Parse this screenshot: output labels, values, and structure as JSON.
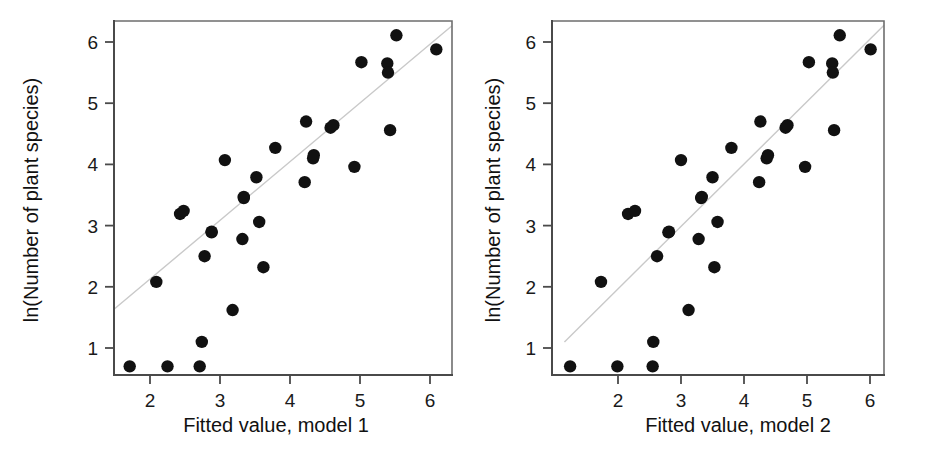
{
  "figure": {
    "background": "#ffffff",
    "point_color": "#111111",
    "line_color": "#c9c9c9",
    "axis_color": "#4a4a4a",
    "panel_count": 2
  },
  "chart_data": [
    {
      "type": "scatter",
      "title": "",
      "xlabel": "Fitted value, model 1",
      "ylabel": "ln(Number of plant species)",
      "xlim": [
        1.4,
        6.35
      ],
      "ylim": [
        0.45,
        6.35
      ],
      "xticks": [
        2,
        3,
        4,
        5,
        6
      ],
      "yticks": [
        1,
        2,
        3,
        4,
        5,
        6
      ],
      "xticklabels": [
        "2",
        "3",
        "4",
        "5",
        "6"
      ],
      "yticklabels": [
        "1",
        "2",
        "3",
        "4",
        "5",
        "6"
      ],
      "grid": false,
      "legend": "none",
      "trendline": {
        "type": "identity-reference",
        "x_start": 1.4,
        "y_start": 1.55,
        "x_end": 6.35,
        "y_end": 6.3
      },
      "x": [
        1.71,
        2.25,
        2.71,
        2.74,
        2.09,
        2.43,
        2.48,
        2.78,
        2.88,
        2.88,
        3.07,
        3.18,
        3.32,
        3.34,
        3.34,
        3.52,
        3.56,
        3.62,
        3.79,
        4.21,
        4.23,
        4.33,
        4.34,
        4.58,
        4.62,
        4.92,
        5.02,
        5.39,
        5.4,
        5.43,
        5.52,
        6.09
      ],
      "y": [
        0.7,
        0.7,
        0.7,
        1.1,
        2.08,
        3.19,
        3.24,
        2.5,
        2.89,
        2.9,
        4.07,
        1.62,
        2.78,
        3.45,
        3.47,
        3.79,
        3.06,
        2.32,
        4.27,
        3.71,
        4.7,
        4.1,
        4.15,
        4.6,
        4.64,
        3.96,
        5.67,
        5.65,
        5.5,
        4.56,
        6.11,
        5.88
      ]
    },
    {
      "type": "scatter",
      "title": "",
      "xlabel": "Fitted value, model 2",
      "ylabel": "ln(Number of plant species)",
      "xlim": [
        1.15,
        6.25
      ],
      "ylim": [
        0.45,
        6.35
      ],
      "xticks": [
        2,
        3,
        4,
        5,
        6
      ],
      "yticks": [
        1,
        2,
        3,
        4,
        5,
        6
      ],
      "xticklabels": [
        "2",
        "3",
        "4",
        "5",
        "6"
      ],
      "yticklabels": [
        "1",
        "2",
        "3",
        "4",
        "5",
        "6"
      ],
      "grid": false,
      "legend": "none",
      "trendline": {
        "type": "identity-reference",
        "x_start": 1.15,
        "y_start": 1.1,
        "x_end": 6.25,
        "y_end": 6.3
      },
      "x": [
        1.24,
        1.99,
        2.55,
        2.56,
        1.73,
        2.16,
        2.27,
        2.62,
        2.8,
        2.81,
        3.0,
        3.12,
        3.28,
        3.32,
        3.33,
        3.5,
        3.58,
        3.53,
        3.8,
        4.24,
        4.26,
        4.36,
        4.38,
        4.66,
        4.69,
        4.97,
        5.03,
        5.4,
        5.41,
        5.43,
        5.52,
        6.01
      ],
      "y": [
        0.7,
        0.7,
        0.7,
        1.1,
        2.08,
        3.19,
        3.24,
        2.5,
        2.89,
        2.9,
        4.07,
        1.62,
        2.78,
        3.45,
        3.47,
        3.79,
        3.06,
        2.32,
        4.27,
        3.71,
        4.7,
        4.1,
        4.15,
        4.6,
        4.64,
        3.96,
        5.67,
        5.65,
        5.5,
        4.56,
        6.11,
        5.88
      ]
    }
  ]
}
